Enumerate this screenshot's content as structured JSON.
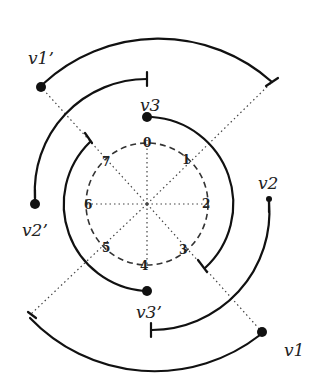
{
  "diagram": {
    "center": {
      "x": 147,
      "y": 204
    },
    "sector_labels": [
      "0",
      "1",
      "2",
      "3",
      "4",
      "5",
      "6",
      "7"
    ],
    "dashed_circle_radius": 61,
    "vertex_labels": {
      "v1": "v1",
      "v1p": "v1’",
      "v2": "v2",
      "v2p": "v2’",
      "v3": "v3",
      "v3p": "v3’"
    },
    "colors": {
      "stroke": "#111111",
      "dotted": "#444444",
      "dashed": "#333333",
      "background": "#ffffff"
    }
  }
}
